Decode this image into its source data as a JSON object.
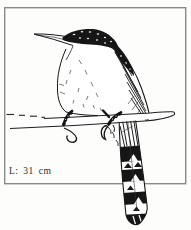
{
  "figure": {
    "length_label": "L: 31 cm",
    "colors": {
      "ink": "#1b1b1b",
      "paper": "#ffffff",
      "frame": "#8a8a8a",
      "label_text": "#2b2b2b"
    }
  }
}
